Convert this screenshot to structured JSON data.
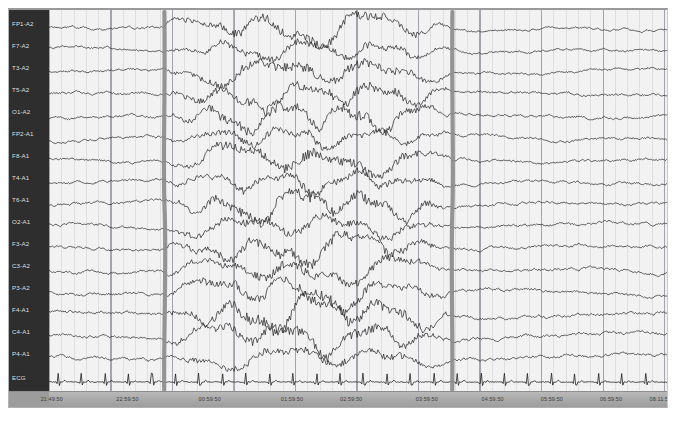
{
  "viewer": {
    "title": "EEG Review",
    "background_color": "#f2f2f2",
    "label_panel_color": "#2e2e2e",
    "trace_color": "#2b2b2b",
    "marker_color": "#8c8c8c",
    "footer_color": "#a8a8a8"
  },
  "channels": [
    {
      "label": "FP1-A2",
      "type": "eeg"
    },
    {
      "label": "F7-A2",
      "type": "eeg"
    },
    {
      "label": "T3-A2",
      "type": "eeg"
    },
    {
      "label": "T5-A2",
      "type": "eeg"
    },
    {
      "label": "O1-A2",
      "type": "eeg"
    },
    {
      "label": "FP2-A1",
      "type": "eeg"
    },
    {
      "label": "F8-A1",
      "type": "eeg"
    },
    {
      "label": "T4-A1",
      "type": "eeg"
    },
    {
      "label": "T6-A1",
      "type": "eeg"
    },
    {
      "label": "O2-A1",
      "type": "eeg"
    },
    {
      "label": "F3-A2",
      "type": "eeg"
    },
    {
      "label": "C3-A2",
      "type": "eeg"
    },
    {
      "label": "P3-A2",
      "type": "eeg"
    },
    {
      "label": "F4-A1",
      "type": "eeg"
    },
    {
      "label": "C4-A1",
      "type": "eeg"
    },
    {
      "label": "P4-A1",
      "type": "eeg"
    },
    {
      "label": "ECG",
      "type": "ecg"
    }
  ],
  "time_axis": {
    "labels": [
      "21:49:50",
      "22:59:50",
      "00:59:50",
      "01:59:50",
      "02:59:50",
      "03:59:50",
      "04:59:50",
      "05:59:50",
      "06:59:50",
      "08:11:50"
    ],
    "positions_pct": [
      6.5,
      18.0,
      30.5,
      43.0,
      52.0,
      63.5,
      73.5,
      82.5,
      91.5,
      99.0
    ]
  },
  "event_markers": [
    {
      "name": "seizure-onset",
      "position_pct": 18.5,
      "label": ""
    },
    {
      "name": "seizure-offset",
      "position_pct": 65.0,
      "label": ""
    }
  ],
  "chart_data": {
    "type": "line",
    "xlabel": "Time",
    "ylabel": "Channel",
    "grid": true,
    "n_channels": 17,
    "segment_note": "High-amplitude rhythmic activity between the two markers",
    "series": [
      {
        "name": "FP1-A2",
        "baseline_y": 18
      },
      {
        "name": "F7-A2",
        "baseline_y": 40
      },
      {
        "name": "T3-A2",
        "baseline_y": 62
      },
      {
        "name": "T5-A2",
        "baseline_y": 84
      },
      {
        "name": "O1-A2",
        "baseline_y": 106
      },
      {
        "name": "FP2-A1",
        "baseline_y": 128
      },
      {
        "name": "F8-A1",
        "baseline_y": 150
      },
      {
        "name": "T4-A1",
        "baseline_y": 172
      },
      {
        "name": "T6-A1",
        "baseline_y": 194
      },
      {
        "name": "O2-A1",
        "baseline_y": 216
      },
      {
        "name": "F3-A2",
        "baseline_y": 238
      },
      {
        "name": "C3-A2",
        "baseline_y": 260
      },
      {
        "name": "P3-A2",
        "baseline_y": 282
      },
      {
        "name": "F4-A1",
        "baseline_y": 304
      },
      {
        "name": "C4-A1",
        "baseline_y": 326
      },
      {
        "name": "P4-A1",
        "baseline_y": 348
      },
      {
        "name": "ECG",
        "baseline_y": 372
      }
    ]
  }
}
